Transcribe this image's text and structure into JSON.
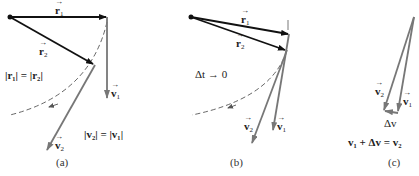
{
  "panels": [
    {
      "id": "a",
      "caption": "(a)",
      "labels": {
        "r1": "r",
        "r1_sub": "1",
        "r2": "r",
        "r2_sub": "2",
        "v1": "v",
        "v1_sub": "1",
        "v2": "v",
        "v2_sub": "2",
        "eq_r": "|r₁| = |r₂|",
        "eq_v": "|v₂| = |v₁|"
      }
    },
    {
      "id": "b",
      "caption": "(b)",
      "labels": {
        "r1": "r",
        "r1_sub": "1",
        "r2": "r",
        "r2_sub": "2",
        "v1": "v",
        "v1_sub": "1",
        "v2": "v",
        "v2_sub": "2",
        "limit": "Δt → 0"
      }
    },
    {
      "id": "c",
      "caption": "(c)",
      "labels": {
        "v1": "v",
        "v1_sub": "1",
        "v2": "v",
        "v2_sub": "2",
        "dv": "Δv",
        "sum": "v₁ + Δv = v₂"
      }
    }
  ],
  "colors": {
    "position_vector": "#111111",
    "velocity_vector": "#777777",
    "path": "#555555"
  }
}
